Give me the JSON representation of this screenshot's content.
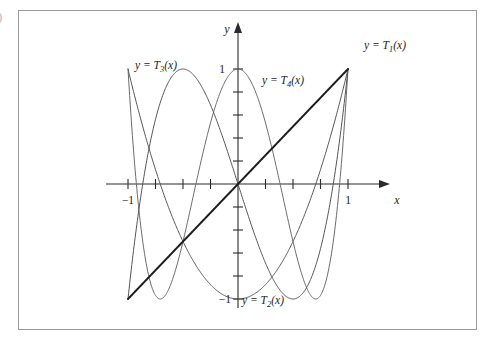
{
  "figure": {
    "tag": ")",
    "background": "#ffffff",
    "frame_color": "#9a9a9e"
  },
  "axes": {
    "x_name": "x",
    "y_name": "y",
    "x_ticklabels": [
      {
        "text": "−1",
        "value": -1
      },
      {
        "text": "1",
        "value": 1
      }
    ],
    "y_ticklabels": [
      {
        "text": "1",
        "value": 1
      },
      {
        "text": "−1",
        "value": -1
      }
    ],
    "axis_color": "#2b2b2b"
  },
  "curve_labels": [
    {
      "id": "T1",
      "prefix": "y = T",
      "sub": "1",
      "suffix": "(x)",
      "text": "y = T₁(x)"
    },
    {
      "id": "T2",
      "prefix": "y = T",
      "sub": "2",
      "suffix": "(x)",
      "text": "y = T₂(x)"
    },
    {
      "id": "T3",
      "prefix": "y = T",
      "sub": "3",
      "suffix": "(x)",
      "text": "y = T₃(x)"
    },
    {
      "id": "T4",
      "prefix": "y = T",
      "sub": "4",
      "suffix": "(x)",
      "text": "y = T₄(x)"
    }
  ],
  "chart_data": {
    "type": "line",
    "title": "",
    "subtitle": "",
    "xlabel": "x",
    "ylabel": "y",
    "xlim": [
      -1.25,
      1.3
    ],
    "ylim": [
      -1.18,
      1.2
    ],
    "xticks": [
      -1,
      -0.75,
      -0.5,
      -0.25,
      0,
      0.25,
      0.5,
      0.75,
      1
    ],
    "yticks": [
      -1,
      -0.8,
      -0.6,
      -0.4,
      -0.2,
      0,
      0.2,
      0.4,
      0.6,
      0.8,
      1
    ],
    "xtick_labels_shown": [
      "-1",
      "1"
    ],
    "ytick_labels_shown": [
      "1",
      "-1"
    ],
    "grid": false,
    "legend": "inline-annotations",
    "axis_style": "arrows-on-positive-ends",
    "domain": [
      -1,
      1
    ],
    "series": [
      {
        "name": "y = T₁(x)",
        "formula": "T1(x) = x",
        "color": "#1d1d1d",
        "width": 2.0,
        "points": [
          [
            -1,
            -1
          ],
          [
            -0.9,
            -0.9
          ],
          [
            -0.8,
            -0.8
          ],
          [
            -0.7,
            -0.7
          ],
          [
            -0.6,
            -0.6
          ],
          [
            -0.5,
            -0.5
          ],
          [
            -0.4,
            -0.4
          ],
          [
            -0.3,
            -0.3
          ],
          [
            -0.2,
            -0.2
          ],
          [
            -0.1,
            -0.1
          ],
          [
            0,
            0
          ],
          [
            0.1,
            0.1
          ],
          [
            0.2,
            0.2
          ],
          [
            0.3,
            0.3
          ],
          [
            0.4,
            0.4
          ],
          [
            0.5,
            0.5
          ],
          [
            0.6,
            0.6
          ],
          [
            0.7,
            0.7
          ],
          [
            0.8,
            0.8
          ],
          [
            0.9,
            0.9
          ],
          [
            1,
            1
          ]
        ]
      },
      {
        "name": "y = T₂(x)",
        "formula": "T2(x) = 2x^2 - 1",
        "color": "#555555",
        "width": 1.0,
        "points": [
          [
            -1,
            1
          ],
          [
            -0.9,
            0.62
          ],
          [
            -0.8,
            0.28
          ],
          [
            -0.7,
            -0.02
          ],
          [
            -0.6,
            -0.28
          ],
          [
            -0.5,
            -0.5
          ],
          [
            -0.4,
            -0.68
          ],
          [
            -0.3,
            -0.82
          ],
          [
            -0.2,
            -0.92
          ],
          [
            -0.1,
            -0.98
          ],
          [
            0,
            -1
          ],
          [
            0.1,
            -0.98
          ],
          [
            0.2,
            -0.92
          ],
          [
            0.3,
            -0.82
          ],
          [
            0.4,
            -0.68
          ],
          [
            0.5,
            -0.5
          ],
          [
            0.6,
            -0.28
          ],
          [
            0.7,
            -0.02
          ],
          [
            0.8,
            0.28
          ],
          [
            0.9,
            0.62
          ],
          [
            1,
            1
          ]
        ]
      },
      {
        "name": "y = T₃(x)",
        "formula": "T3(x) = 4x^3 - 3x",
        "color": "#555555",
        "width": 1.0,
        "points": [
          [
            -1,
            -1
          ],
          [
            -0.9,
            -0.216
          ],
          [
            -0.8,
            0.352
          ],
          [
            -0.7,
            0.728
          ],
          [
            -0.6,
            0.936
          ],
          [
            -0.5,
            1.0
          ],
          [
            -0.4,
            0.944
          ],
          [
            -0.3,
            0.792
          ],
          [
            -0.2,
            0.568
          ],
          [
            -0.1,
            0.296
          ],
          [
            0,
            0
          ],
          [
            0.1,
            -0.296
          ],
          [
            0.2,
            -0.568
          ],
          [
            0.3,
            -0.792
          ],
          [
            0.4,
            -0.944
          ],
          [
            0.5,
            -1.0
          ],
          [
            0.6,
            -0.936
          ],
          [
            0.7,
            -0.728
          ],
          [
            0.8,
            -0.352
          ],
          [
            0.9,
            0.216
          ],
          [
            1,
            1
          ]
        ]
      },
      {
        "name": "y = T₄(x)",
        "formula": "T4(x) = 8x^4 - 8x^2 + 1",
        "color": "#6b6b6b",
        "width": 1.0,
        "points": [
          [
            -1,
            1
          ],
          [
            -0.9,
            -0.1112
          ],
          [
            -0.8,
            -0.8432
          ],
          [
            -0.7,
            -0.9928
          ],
          [
            -0.6,
            -0.6992
          ],
          [
            -0.5,
            -0.5
          ],
          [
            -0.4,
            0.0208
          ],
          [
            -0.3,
            0.5768
          ],
          [
            -0.2,
            0.6848
          ],
          [
            -0.1,
            0.9208
          ],
          [
            0,
            1
          ],
          [
            0.1,
            0.9208
          ],
          [
            0.2,
            0.6848
          ],
          [
            0.3,
            0.5768
          ],
          [
            0.4,
            0.0208
          ],
          [
            0.5,
            -0.5
          ],
          [
            0.6,
            -0.6992
          ],
          [
            0.7,
            -0.9928
          ],
          [
            0.8,
            -0.8432
          ],
          [
            0.9,
            -0.1112
          ],
          [
            1,
            1
          ]
        ]
      }
    ],
    "annotations": [
      {
        "text": "y = T₁(x)",
        "x": 1.05,
        "y": 1.17
      },
      {
        "text": "y = T₄(x)",
        "x": 0.12,
        "y": 0.92
      },
      {
        "text": "y = T₃(x)",
        "x": -0.78,
        "y": 1.02
      },
      {
        "text": "y = T₂(x)",
        "x": 0.02,
        "y": -1.02
      }
    ]
  }
}
